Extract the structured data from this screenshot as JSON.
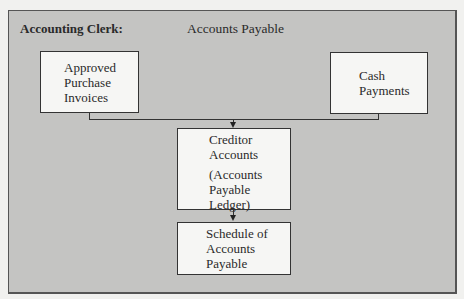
{
  "header": {
    "role_label": "Accounting Clerk:",
    "title": "Accounts Payable"
  },
  "nodes": {
    "approved_invoices": {
      "lines": [
        "Approved",
        "Purchase",
        "Invoices"
      ]
    },
    "cash_payments": {
      "lines": [
        "Cash",
        "Payments"
      ]
    },
    "creditor_accounts": {
      "lines": [
        "Creditor",
        "Accounts"
      ],
      "sub_lines": [
        "(Accounts",
        "Payable",
        "Ledger)"
      ]
    },
    "schedule": {
      "lines": [
        "Schedule of",
        "Accounts",
        "Payable"
      ]
    }
  },
  "edges": [
    {
      "from": "approved_invoices",
      "to": "creditor_accounts"
    },
    {
      "from": "cash_payments",
      "to": "creditor_accounts"
    },
    {
      "from": "creditor_accounts",
      "to": "schedule"
    }
  ],
  "colors": {
    "panel_bg": "#c4c4c2",
    "box_bg": "#f6f6f4",
    "line": "#333333",
    "page_bg": "#f1f1ef"
  }
}
